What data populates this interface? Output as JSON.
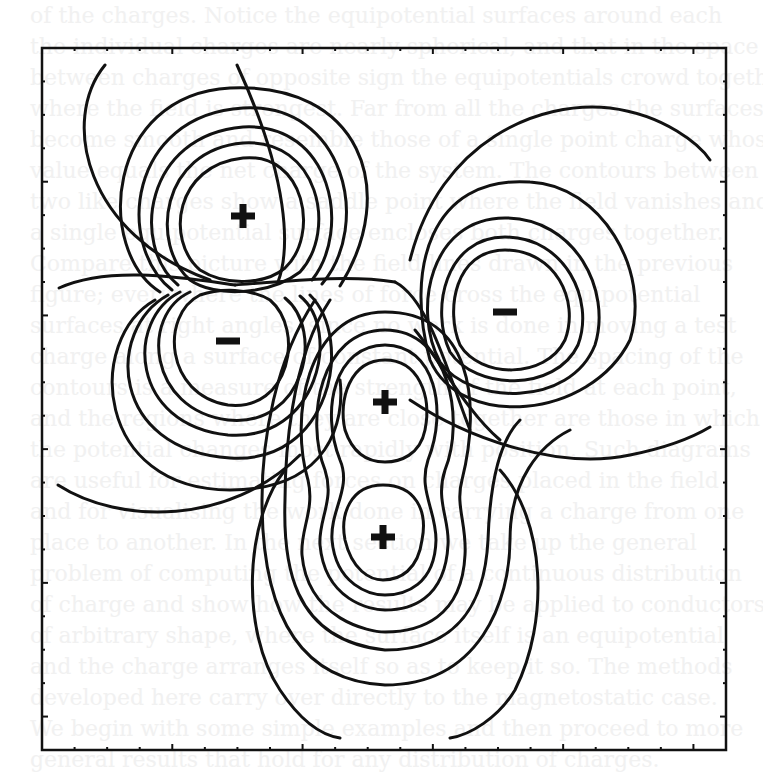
{
  "figure": {
    "background_color": "#ffffff",
    "line_color": "#111111",
    "frame": {
      "left": 42,
      "top": 48,
      "right": 726,
      "bottom": 750
    },
    "charges": [
      {
        "id": "q1",
        "sign": "+",
        "x": 243,
        "y": 216
      },
      {
        "id": "q2",
        "sign": "-",
        "x": 228,
        "y": 341
      },
      {
        "id": "q3",
        "sign": "-",
        "x": 505,
        "y": 312
      },
      {
        "id": "q4",
        "sign": "+",
        "x": 385,
        "y": 402
      },
      {
        "id": "q5",
        "sign": "+",
        "x": 383,
        "y": 537
      }
    ]
  },
  "bleed_through_text": [
    "of the charges. Notice the equipotential surfaces around each",
    "the individual charges are nearly spherical, and that in the space",
    "between charges of opposite sign the equipotentials crowd together",
    "where the field is strongest. Far from all the charges the surfaces",
    "become smooth and resemble those of a single point charge whose",
    "value equals the net charge of the system. The contours between",
    "two like charges show a saddle point where the field vanishes and",
    "a single equipotential surface encloses both charges together.",
    "Compare this picture with the field lines drawn in the previous",
    "figure; everywhere the lines of force cross the equipotential",
    "surfaces at right angles, since no work is done in moving a test",
    "charge along a surface of constant potential. The spacing of the",
    "contours is a measure of the strength of the field at each point,",
    "and the regions where they are close together are those in which",
    "the potential changes most rapidly with position. Such diagrams",
    "are useful for estimating forces on charges placed in the field",
    "and for visualising the work done in carrying a charge from one",
    "place to another. In the next section we take up the general",
    "problem of computing the potential of a continuous distribution",
    "of charge and show how the results may be applied to conductors",
    "of arbitrary shape, where the surface itself is an equipotential",
    "and the charge arranges itself so as to keep it so. The methods",
    "developed here carry over directly to the magnetostatic case.",
    "We begin with some simple examples and then proceed to more",
    "general results that hold for any distribution of charges."
  ]
}
